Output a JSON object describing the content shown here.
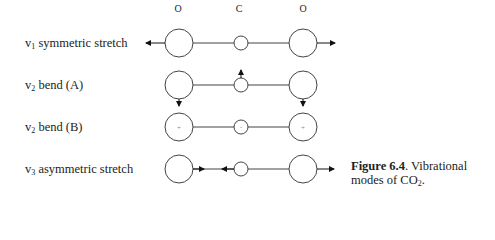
{
  "atom_labels": {
    "left": "O",
    "center": "C",
    "right": "O"
  },
  "modes": [
    {
      "symbol": "v",
      "sub": "1",
      "name": "symmetric stretch"
    },
    {
      "symbol": "v",
      "sub": "2",
      "name": "bend (A)"
    },
    {
      "symbol": "v",
      "sub": "2",
      "name": "bend (B)"
    },
    {
      "symbol": "v",
      "sub": "3",
      "name": "asymmetric stretch"
    }
  ],
  "bend_b_marks": {
    "left": "+",
    "center": "-",
    "right": "+"
  },
  "caption": {
    "figure_label": "Figure 6.4",
    "text_1": ". Vibrational",
    "text_2": "modes of CO",
    "subscript": "2",
    "end": "."
  }
}
